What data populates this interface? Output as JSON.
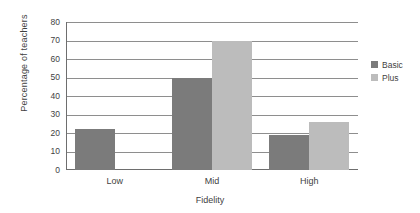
{
  "chart_data": {
    "type": "bar",
    "title": "",
    "xlabel": "Fidelity",
    "ylabel": "Percentage of teachers",
    "categories": [
      "Low",
      "Mid",
      "High"
    ],
    "series": [
      {
        "name": "Basic",
        "color": "#7b7b7b",
        "values": [
          22,
          50,
          19
        ]
      },
      {
        "name": "Plus",
        "color": "#bcbcbc",
        "values": [
          0,
          70,
          26
        ]
      }
    ],
    "ylim": [
      0,
      80
    ],
    "yticks": [
      0,
      10,
      20,
      30,
      40,
      50,
      60,
      70,
      80
    ],
    "ytick_labels": [
      "0",
      "10",
      "20",
      "30",
      "40",
      "50",
      "60",
      "70",
      "80"
    ],
    "grid": true,
    "grid_axis": "y",
    "legend_position": "right",
    "legend_entries": [
      "Basic",
      "Plus"
    ]
  }
}
